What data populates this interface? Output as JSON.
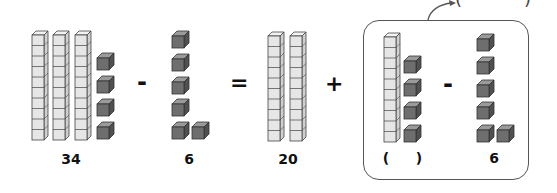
{
  "equation": {
    "minuend": {
      "label": "34",
      "tens": 3,
      "ones": 4
    },
    "op1": "-",
    "subtrahend": {
      "label": "6",
      "ones": 6
    },
    "op2": "=",
    "tens_part": {
      "label": "20",
      "tens": 2
    },
    "op3": "+",
    "grouped": {
      "left": {
        "label_open": "(",
        "label_close": ")",
        "tens": 1,
        "ones": 4
      },
      "op": "-",
      "right": {
        "label": "6",
        "ones": 6
      }
    },
    "result_blank": {
      "open": "(",
      "close": ")"
    }
  },
  "colors": {
    "ten_rod_fill": "#e6e6e6",
    "ten_rod_side": "#d0d0d0",
    "ten_rod_top": "#f2f2f2",
    "unit_front": "#6e6e6e",
    "unit_side": "#505050",
    "unit_top": "#9a9a9a",
    "stroke": "#444444",
    "box_border": "#555555"
  }
}
